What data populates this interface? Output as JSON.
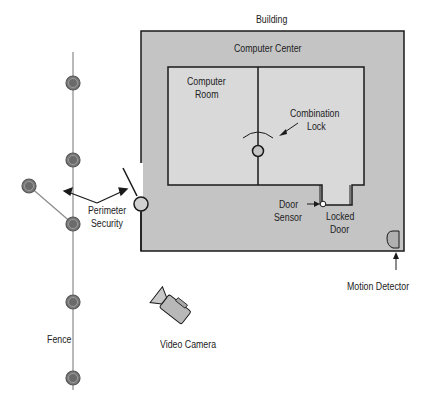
{
  "diagram": {
    "type": "physical-security-layout",
    "labels": {
      "building": "Building",
      "computer_center": "Computer Center",
      "computer_room_line1": "Computer",
      "computer_room_line2": "Room",
      "combination_lock_line1": "Combination",
      "combination_lock_line2": "Lock",
      "door_sensor_line1": "Door",
      "door_sensor_line2": "Sensor",
      "locked_door_line1": "Locked",
      "locked_door_line2": "Door",
      "motion_detector": "Motion Detector",
      "perimeter_security_line1": "Perimeter",
      "perimeter_security_line2": "Security",
      "fence": "Fence",
      "video_camera": "Video Camera"
    },
    "colors": {
      "building_fill": "#c4c4c4",
      "room_fill": "#d9d9d9",
      "outline": "#1a1a1a",
      "fence_post": "#808080",
      "fence_line": "#8a8a8a"
    },
    "fence_posts": [
      {
        "x": 73,
        "y": 83
      },
      {
        "x": 73,
        "y": 160
      },
      {
        "x": 29,
        "y": 186
      },
      {
        "x": 73,
        "y": 224
      },
      {
        "x": 73,
        "y": 302
      },
      {
        "x": 73,
        "y": 378
      }
    ]
  }
}
